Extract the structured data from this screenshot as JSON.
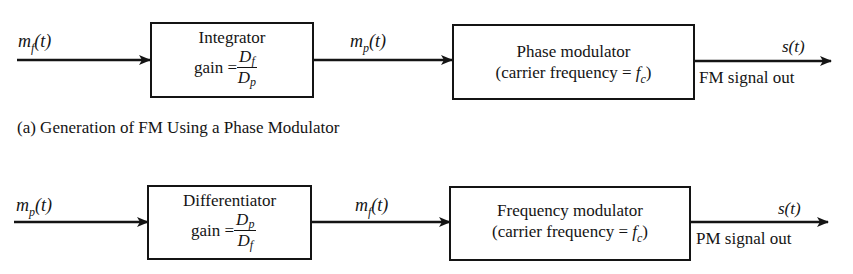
{
  "diagram": {
    "top": {
      "input_signal": {
        "main": "m",
        "sub": "f",
        "arg": "(t)"
      },
      "block1": {
        "title": "Integrator",
        "gain_label": "gain =",
        "gain_num_main": "D",
        "gain_num_sub": "f",
        "gain_den_main": "D",
        "gain_den_sub": "p"
      },
      "mid_signal": {
        "main": "m",
        "sub": "p",
        "arg": "(t)"
      },
      "block2": {
        "line1": "Phase modulator",
        "line2_prefix": "(carrier frequency = ",
        "line2_var": "f",
        "line2_sub": "c",
        "line2_suffix": ")"
      },
      "output_signal": "s(t)",
      "output_label": "FM signal out",
      "caption": "(a)  Generation of FM Using a Phase Modulator"
    },
    "bottom": {
      "input_signal": {
        "main": "m",
        "sub": "p",
        "arg": "(t)"
      },
      "block1": {
        "title": "Differentiator",
        "gain_label": "gain =",
        "gain_num_main": "D",
        "gain_num_sub": "p",
        "gain_den_main": "D",
        "gain_den_sub": "f"
      },
      "mid_signal": {
        "main": "m",
        "sub": "f",
        "arg": "(t)"
      },
      "block2": {
        "line1": "Frequency modulator",
        "line2_prefix": "(carrier frequency = ",
        "line2_var": "f",
        "line2_sub": "c",
        "line2_suffix": ")"
      },
      "output_signal": "s(t)",
      "output_label": "PM signal out"
    },
    "colors": {
      "ink": "#141414",
      "background": "#ffffff"
    }
  }
}
